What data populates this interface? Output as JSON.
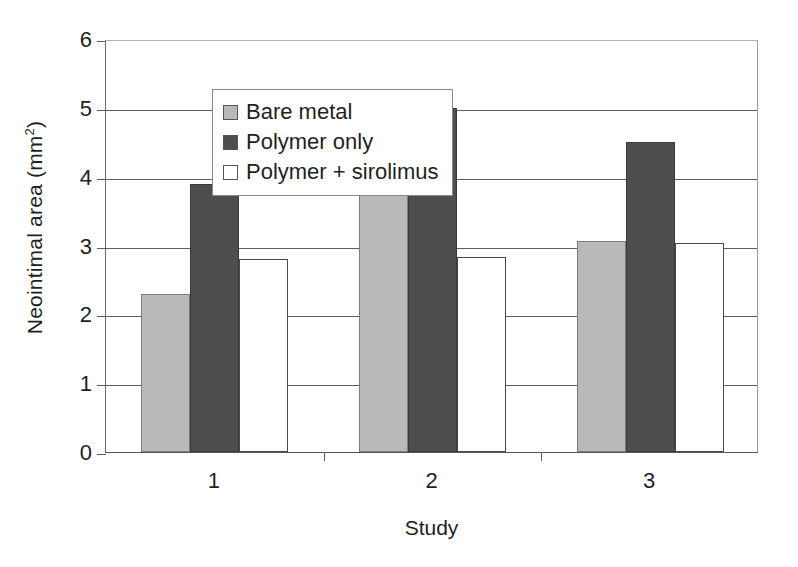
{
  "chart_data": {
    "type": "bar",
    "title": "",
    "xlabel": "Study",
    "ylabel": "Neointimal area (mm2)",
    "ylabel_base": "Neointimal area (mm",
    "ylabel_sup": "2",
    "ylabel_tail": ")",
    "categories": [
      "1",
      "2",
      "3"
    ],
    "ylim": [
      0,
      6
    ],
    "yticks": [
      0,
      1,
      2,
      3,
      4,
      5,
      6
    ],
    "ytick_labels": [
      "0",
      "1",
      "2",
      "3",
      "4",
      "5",
      "6"
    ],
    "grid": "horizontal",
    "legend_position": "top-left-inside",
    "series": [
      {
        "name": "Bare metal",
        "color": "#b9b9b9",
        "values": [
          2.3,
          4.57,
          3.07
        ]
      },
      {
        "name": "Polymer only",
        "color": "#4e4e4e",
        "values": [
          3.9,
          5.0,
          4.5
        ]
      },
      {
        "name": "Polymer + sirolimus",
        "color": "#ffffff",
        "values": [
          2.8,
          2.83,
          3.03
        ]
      }
    ]
  }
}
